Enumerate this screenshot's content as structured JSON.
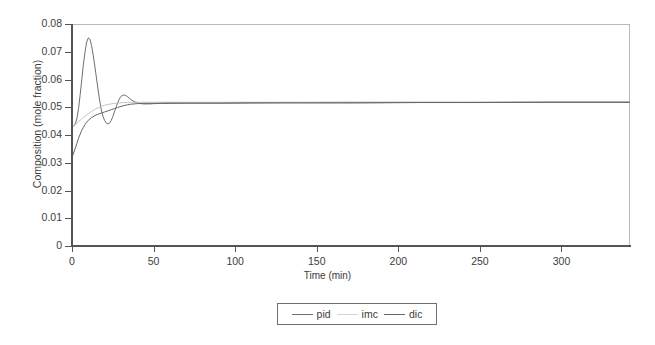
{
  "chart_data": {
    "type": "line",
    "title": "",
    "xlabel": "Time (min)",
    "ylabel": "Composition (mole fraction)",
    "xlim": [
      0,
      342
    ],
    "ylim": [
      0,
      0.08
    ],
    "grid": false,
    "legend_position": "bottom-center",
    "xticks": [
      0,
      50,
      100,
      150,
      200,
      250,
      300
    ],
    "xtick_labels": [
      "0",
      "50",
      "100",
      "150",
      "200",
      "250",
      "300"
    ],
    "yticks": [
      0,
      0.01,
      0.02,
      0.03,
      0.04,
      0.05,
      0.06,
      0.07,
      0.08
    ],
    "ytick_labels": [
      "0",
      "0.01",
      "0.02",
      "0.03",
      "0.04",
      "0.05",
      "0.06",
      "0.07",
      "0.08"
    ],
    "series": [
      {
        "name": "pid",
        "color": "#6e6e6e",
        "x": [
          0,
          1,
          2,
          3,
          4,
          5,
          6,
          7,
          8,
          9,
          10,
          11,
          12,
          13,
          14,
          15,
          16,
          17,
          18,
          19,
          20,
          21,
          22,
          23,
          24,
          25,
          26,
          27,
          28,
          29,
          30,
          31,
          32,
          33,
          34,
          35,
          36,
          38,
          40,
          42,
          44,
          46,
          48,
          50,
          55,
          60,
          70,
          85,
          100,
          130,
          170,
          210,
          250,
          290,
          342
        ],
        "y": [
          0.043,
          0.0432,
          0.044,
          0.046,
          0.0495,
          0.0545,
          0.06,
          0.0655,
          0.07,
          0.0735,
          0.075,
          0.0745,
          0.0722,
          0.0688,
          0.0648,
          0.0605,
          0.0562,
          0.0523,
          0.049,
          0.0467,
          0.0452,
          0.0443,
          0.044,
          0.0443,
          0.0452,
          0.0466,
          0.0483,
          0.05,
          0.0516,
          0.053,
          0.0539,
          0.0543,
          0.0544,
          0.0542,
          0.0538,
          0.0533,
          0.0528,
          0.0521,
          0.0516,
          0.0513,
          0.0512,
          0.0512,
          0.0512,
          0.0513,
          0.0514,
          0.0514,
          0.0515,
          0.0515,
          0.0515,
          0.0516,
          0.0516,
          0.0517,
          0.0517,
          0.0518,
          0.0518
        ]
      },
      {
        "name": "imc",
        "color": "#c2c2c2",
        "x": [
          0,
          2,
          4,
          6,
          8,
          10,
          12,
          14,
          16,
          18,
          20,
          22,
          24,
          26,
          28,
          30,
          32,
          34,
          36,
          38,
          40,
          44,
          48,
          52,
          58,
          64,
          72,
          82,
          95,
          115,
          140,
          170,
          200,
          240,
          280,
          310,
          342
        ],
        "y": [
          0.043,
          0.0438,
          0.0448,
          0.0458,
          0.0468,
          0.0477,
          0.0485,
          0.0492,
          0.0498,
          0.0503,
          0.0507,
          0.051,
          0.0512,
          0.0514,
          0.0515,
          0.0516,
          0.0517,
          0.0517,
          0.0518,
          0.0518,
          0.0518,
          0.0518,
          0.0518,
          0.0518,
          0.0518,
          0.0518,
          0.0518,
          0.0518,
          0.0518,
          0.0518,
          0.0518,
          0.0519,
          0.0519,
          0.0519,
          0.052,
          0.052,
          0.052
        ]
      },
      {
        "name": "dic",
        "color": "#666666",
        "x": [
          0,
          1,
          2,
          3,
          4,
          5,
          6,
          7,
          8,
          9,
          10,
          12,
          14,
          16,
          18,
          20,
          22,
          24,
          26,
          28,
          30,
          32,
          34,
          36,
          38,
          40,
          44,
          48,
          52,
          58,
          65,
          75,
          90,
          110,
          140,
          175,
          215,
          255,
          295,
          342
        ],
        "y": [
          0.032,
          0.0335,
          0.0352,
          0.037,
          0.0388,
          0.0403,
          0.0417,
          0.0428,
          0.0438,
          0.0446,
          0.0453,
          0.0463,
          0.047,
          0.0475,
          0.0479,
          0.0483,
          0.0487,
          0.0491,
          0.0495,
          0.0499,
          0.0503,
          0.0506,
          0.0509,
          0.0511,
          0.0512,
          0.0513,
          0.0514,
          0.0514,
          0.0514,
          0.0515,
          0.0515,
          0.0515,
          0.0515,
          0.0516,
          0.0516,
          0.0516,
          0.0517,
          0.0517,
          0.0518,
          0.0518
        ]
      }
    ]
  },
  "legend": {
    "entries": [
      {
        "label": "pid",
        "color": "#6e6e6e"
      },
      {
        "label": "imc",
        "color": "#d4d4d4"
      },
      {
        "label": "dic",
        "color": "#666666"
      }
    ]
  }
}
